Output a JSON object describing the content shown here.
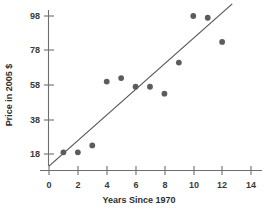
{
  "chart_data": {
    "type": "scatter",
    "title": "",
    "xlabel": "Years Since 1970",
    "ylabel": "Price in 2005 $",
    "xlim": [
      0,
      15
    ],
    "ylim": [
      10,
      102
    ],
    "grid": false,
    "legend": "none",
    "xticks": [
      0,
      2,
      4,
      6,
      8,
      10,
      12,
      14
    ],
    "yticks": [
      18,
      38,
      58,
      78,
      98
    ],
    "xtick_labels": [
      "0",
      "2",
      "4",
      "6",
      "8",
      "10",
      "12",
      "14"
    ],
    "ytick_labels": [
      "18",
      "38",
      "58",
      "78",
      "98"
    ],
    "points": [
      {
        "x": 1,
        "y": 19
      },
      {
        "x": 2,
        "y": 19
      },
      {
        "x": 3,
        "y": 23
      },
      {
        "x": 4,
        "y": 60
      },
      {
        "x": 5,
        "y": 62
      },
      {
        "x": 6,
        "y": 57
      },
      {
        "x": 7,
        "y": 57
      },
      {
        "x": 8,
        "y": 53
      },
      {
        "x": 9,
        "y": 71
      },
      {
        "x": 10,
        "y": 98
      },
      {
        "x": 11,
        "y": 97
      },
      {
        "x": 12,
        "y": 83
      }
    ],
    "trend_line": {
      "x_start": 0,
      "y_start": 11,
      "x_end": 12.7,
      "y_end": 105
    },
    "marker_color": "#5b5b63",
    "line_color": "#555555",
    "axis_color": "#6e6e6e",
    "background_color": "#ffffff"
  }
}
